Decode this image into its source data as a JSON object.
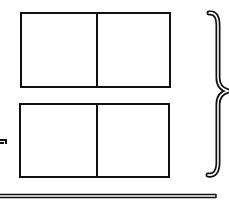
{
  "diagram": {
    "background": "#ffffff",
    "stroke_color": "#111111",
    "boxes": [
      {
        "id": "top-box",
        "x": 20,
        "y": 12,
        "width": 151,
        "height": 76,
        "divider_x": 95,
        "cells": 2
      },
      {
        "id": "bottom-box",
        "x": 19,
        "y": 103,
        "width": 151,
        "height": 75,
        "divider_x": 95,
        "cells": 2
      }
    ],
    "brace": {
      "side": "right",
      "x": 207,
      "y_top": 12,
      "y_mid": 90,
      "y_bottom": 176,
      "tip_x": 228
    },
    "rule": {
      "style": "double",
      "x1": 0,
      "x2": 216,
      "y": 196
    },
    "edge_mark": {
      "x": 0,
      "y": 141,
      "note": "clipped glyph at left edge"
    }
  }
}
